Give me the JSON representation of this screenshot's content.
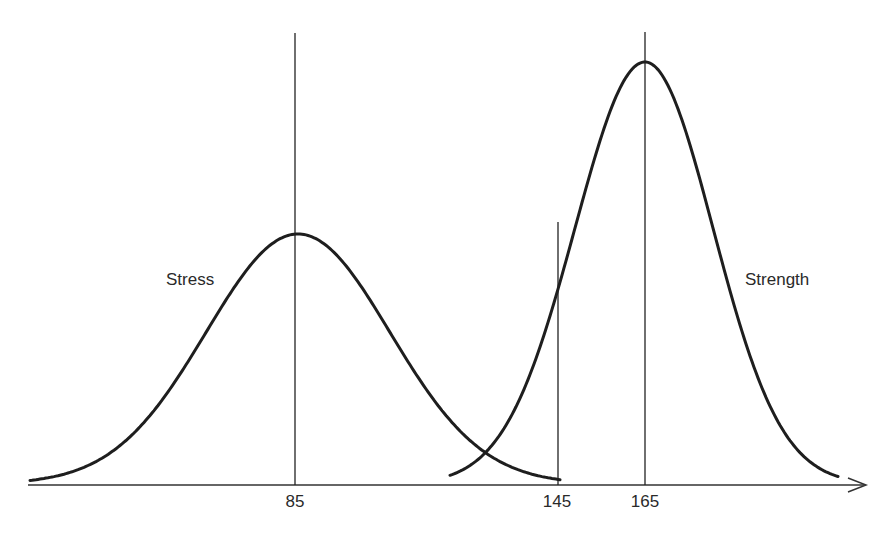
{
  "chart_data": {
    "type": "line",
    "title": "",
    "xlabel": "",
    "ylabel": "",
    "grid": false,
    "legend": "none (curves labeled inline)",
    "x_ticks": [
      {
        "value": 85,
        "label": "85"
      },
      {
        "value": 145,
        "label": "145"
      },
      {
        "value": 165,
        "label": "165"
      }
    ],
    "series": [
      {
        "name": "Stress",
        "distribution": "normal",
        "mean": 85,
        "peak_relative_height": 0.59,
        "support": [
          25,
          145
        ]
      },
      {
        "name": "Strength",
        "distribution": "normal",
        "mean": 165,
        "peak_relative_height": 1.0,
        "support": [
          125,
          210
        ]
      }
    ],
    "vertical_lines": [
      {
        "x": 85,
        "note": "mean of stress"
      },
      {
        "x": 145,
        "note": "upper limit of stress"
      },
      {
        "x": 165,
        "note": "mean of strength"
      }
    ],
    "annotations": [
      "Stress",
      "Strength"
    ]
  },
  "labels": {
    "stress": "Stress",
    "strength": "Strength",
    "tick_85": "85",
    "tick_145": "145",
    "tick_165": "165"
  },
  "colors": {
    "curve": "#1e1e1e",
    "axis": "#333333",
    "text": "#2a2a2a"
  }
}
